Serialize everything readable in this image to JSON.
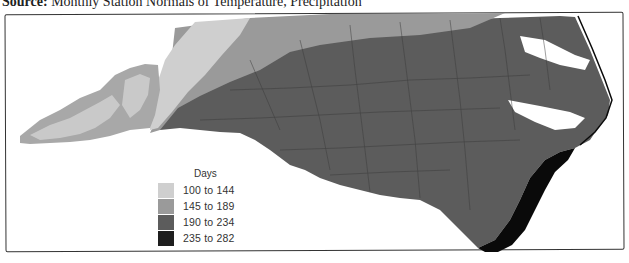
{
  "source": {
    "prefix": "Source:",
    "text": "Monthly Station Normals of Temperature, Precipitation"
  },
  "legend": {
    "title": "Days",
    "items": [
      {
        "label": "100 to 144",
        "color": "#cfcfcf"
      },
      {
        "label": "145 to 189",
        "color": "#9a9a9a"
      },
      {
        "label": "190 to 234",
        "color": "#5c5c5c"
      },
      {
        "label": "235 to 282",
        "color": "#1e1e1e"
      }
    ]
  },
  "map": {
    "region": "North Carolina",
    "colors": {
      "light": "#cfcfcf",
      "mid": "#9a9a9a",
      "dark": "#5c5c5c",
      "darkest": "#0a0a0a",
      "water": "#ffffff",
      "county_lines": "#3a3a3a"
    }
  }
}
